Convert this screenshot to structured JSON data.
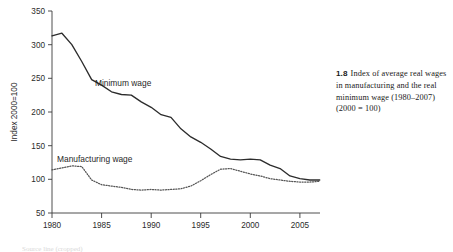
{
  "caption": {
    "number": "1.8",
    "text": "Index of average real wages in manufacturing and the real minimum wage (1980–2007) (2000 = 100)"
  },
  "labels": {
    "minimum_wage": "Minimum wage",
    "manufacturing_wage": "Manufacturing wage"
  },
  "chart_data": {
    "type": "line",
    "title": "",
    "xlabel": "",
    "ylabel": "Index 2000=100",
    "xlim": [
      1980,
      2007
    ],
    "ylim": [
      50,
      350
    ],
    "yticks": [
      50,
      100,
      150,
      200,
      250,
      300,
      350
    ],
    "xticks": [
      1980,
      1985,
      1990,
      1995,
      2000,
      2005
    ],
    "ytick_labels": [
      "50",
      "100",
      "150",
      "200",
      "250",
      "300",
      "350"
    ],
    "xtick_labels": [
      "1980",
      "1985",
      "1990",
      "1995",
      "2000",
      "2005"
    ],
    "grid": false,
    "legend": "inline-annotations",
    "x": [
      1980,
      1981,
      1982,
      1983,
      1984,
      1985,
      1986,
      1987,
      1988,
      1989,
      1990,
      1991,
      1992,
      1993,
      1994,
      1995,
      1996,
      1997,
      1998,
      1999,
      2000,
      2001,
      2002,
      2003,
      2004,
      2005,
      2006,
      2007
    ],
    "series": [
      {
        "name": "Minimum wage",
        "style": "solid",
        "color": "#2c2c2c",
        "values": [
          313,
          317,
          300,
          275,
          248,
          240,
          230,
          226,
          225,
          215,
          207,
          196,
          192,
          175,
          163,
          155,
          145,
          134,
          130,
          129,
          130,
          129,
          121,
          116,
          105,
          101,
          99,
          99
        ]
      },
      {
        "name": "Manufacturing wage",
        "style": "dotted",
        "color": "#555555",
        "values": [
          114,
          117,
          120,
          119,
          99,
          92,
          90,
          88,
          85,
          84,
          85,
          84,
          85,
          86,
          90,
          98,
          107,
          115,
          116,
          112,
          108,
          105,
          101,
          99,
          97,
          96,
          96,
          97
        ]
      }
    ]
  },
  "source_strip": "Source line (cropped)"
}
